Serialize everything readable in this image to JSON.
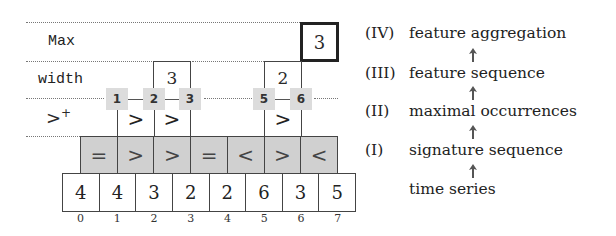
{
  "diagram": {
    "row_labels": {
      "max": "Max",
      "width": "width",
      "gt_plus": ">",
      "gt_plus_sup": "+"
    },
    "max_value": "3",
    "widths": [
      "3",
      "2"
    ],
    "chips": [
      "1",
      "2",
      "3",
      "5",
      "6"
    ],
    "gt_marks": [
      ">",
      ">",
      ">"
    ],
    "signature_sequence": [
      "=",
      ">",
      ">",
      "=",
      "<",
      ">",
      "<"
    ],
    "time_series": [
      "4",
      "4",
      "3",
      "2",
      "2",
      "6",
      "3",
      "5"
    ],
    "indices": [
      "0",
      "1",
      "2",
      "3",
      "4",
      "5",
      "6",
      "7"
    ]
  },
  "legend": {
    "steps": [
      {
        "numeral": "(IV)",
        "label": "feature aggregation"
      },
      {
        "numeral": "(III)",
        "label": "feature sequence"
      },
      {
        "numeral": "(II)",
        "label": "maximal occurrences"
      },
      {
        "numeral": "(I)",
        "label": "signature sequence"
      },
      {
        "numeral": "",
        "label": "time series"
      }
    ]
  }
}
